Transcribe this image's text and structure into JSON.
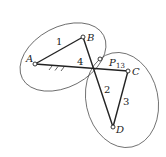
{
  "diagram": {
    "type": "four-bar linkage instant centers",
    "points": {
      "A": {
        "label": "A",
        "x": 35,
        "y": 64
      },
      "B": {
        "label": "B",
        "x": 83,
        "y": 37
      },
      "C": {
        "label": "C",
        "x": 128,
        "y": 71
      },
      "D": {
        "label": "D",
        "x": 113,
        "y": 127
      },
      "P13": {
        "label": "P",
        "sub": "13",
        "x": 100,
        "y": 59
      }
    },
    "links": [
      {
        "label": "1",
        "from": "A",
        "to": "B"
      },
      {
        "label": "2",
        "from": "B",
        "to": "D"
      },
      {
        "label": "3",
        "from": "C",
        "to": "D"
      },
      {
        "label": "4",
        "from": "A",
        "to": "C"
      }
    ],
    "colors": {
      "line": "#222222",
      "ellipse": "#444444"
    }
  }
}
